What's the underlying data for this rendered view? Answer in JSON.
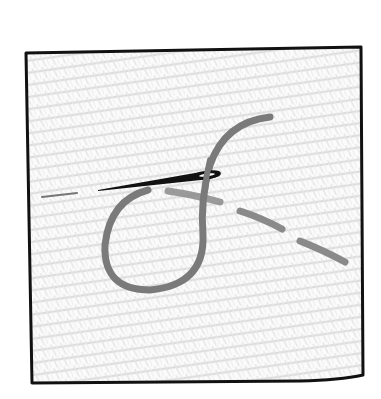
{
  "illustration": {
    "subject": "needle-and-thread-on-fabric-icon",
    "colors": {
      "background": "#ffffff",
      "fabric_fill": "#fbfbfb",
      "fabric_weave": "#d8d8d8",
      "frame_border": "#111111",
      "thread": "#7a7a7a",
      "thread_dash": "#8a8a8a",
      "needle": "#111111"
    }
  }
}
